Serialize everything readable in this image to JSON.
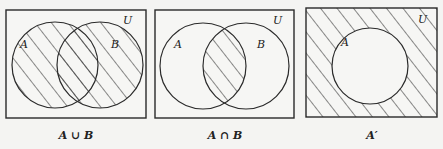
{
  "diagrams": [
    {
      "id": "union",
      "caption": "A ∪ B",
      "universe_label": "U",
      "sets": [
        {
          "label": "A"
        },
        {
          "label": "B"
        }
      ],
      "shaded_region": "A ∪ B"
    },
    {
      "id": "intersection",
      "caption": "A ∩ B",
      "universe_label": "U",
      "sets": [
        {
          "label": "A"
        },
        {
          "label": "B"
        }
      ],
      "shaded_region": "A ∩ B"
    },
    {
      "id": "complement",
      "caption": "A′",
      "universe_label": "U",
      "sets": [
        {
          "label": "A"
        }
      ],
      "shaded_region": "U − A"
    }
  ],
  "colors": {
    "ink": "#2a2a2a",
    "paper": "#f4f4f2"
  }
}
